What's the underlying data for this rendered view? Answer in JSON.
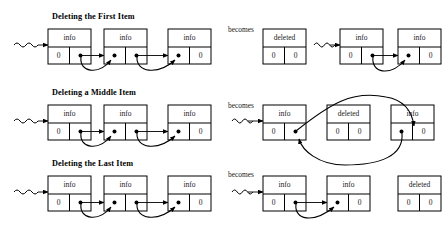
{
  "figure": {
    "background_color": "#ffffff",
    "stroke_color": "#000000",
    "text_color": "#1a1a1a",
    "width": 448,
    "height": 230
  },
  "labels": {
    "info": "info",
    "zero": "0",
    "deleted": "deleted",
    "becomes": "becomes"
  },
  "rows": [
    {
      "id": "first",
      "title": "Deleting the First Item",
      "becomes": "becomes",
      "before": {
        "head_squiggle": true,
        "nodes": [
          {
            "top": "info",
            "left": "0",
            "right": "pointer",
            "state": "normal"
          },
          {
            "top": "info",
            "left": "pointer",
            "right": "pointer",
            "state": "normal"
          },
          {
            "top": "info",
            "left": "pointer",
            "right": "0",
            "state": "normal"
          }
        ]
      },
      "after": {
        "nodes": [
          {
            "top": "deleted",
            "left": "0",
            "right": "0",
            "state": "deleted"
          },
          {
            "top": "info",
            "left": "0",
            "right": "pointer",
            "state": "normal"
          },
          {
            "top": "info",
            "left": "pointer",
            "right": "0",
            "state": "normal"
          }
        ],
        "head_squiggle_before_index": 1
      }
    },
    {
      "id": "middle",
      "title": "Deleting a Middle Item",
      "becomes": "becomes",
      "before": {
        "head_squiggle": true,
        "nodes": [
          {
            "top": "info",
            "left": "0",
            "right": "pointer",
            "state": "normal"
          },
          {
            "top": "info",
            "left": "pointer",
            "right": "pointer",
            "state": "normal"
          },
          {
            "top": "info",
            "left": "pointer",
            "right": "0",
            "state": "normal"
          }
        ]
      },
      "after": {
        "nodes": [
          {
            "top": "info",
            "left": "0",
            "right": "pointer",
            "state": "normal"
          },
          {
            "top": "deleted",
            "left": "0",
            "right": "0",
            "state": "deleted"
          },
          {
            "top": "info",
            "left": "pointer",
            "right": "0",
            "state": "normal"
          }
        ],
        "head_squiggle_before_index": 0
      }
    },
    {
      "id": "last",
      "title": "Deleting the Last Item",
      "becomes": "becomes",
      "before": {
        "head_squiggle": true,
        "nodes": [
          {
            "top": "info",
            "left": "0",
            "right": "pointer",
            "state": "normal"
          },
          {
            "top": "info",
            "left": "pointer",
            "right": "pointer",
            "state": "normal"
          },
          {
            "top": "info",
            "left": "pointer",
            "right": "0",
            "state": "normal"
          }
        ]
      },
      "after": {
        "nodes": [
          {
            "top": "info",
            "left": "0",
            "right": "pointer",
            "state": "normal"
          },
          {
            "top": "info",
            "left": "pointer",
            "right": "0",
            "state": "normal"
          },
          {
            "top": "deleted",
            "left": "0",
            "right": "0",
            "state": "deleted"
          }
        ],
        "head_squiggle_before_index": 0
      }
    }
  ]
}
